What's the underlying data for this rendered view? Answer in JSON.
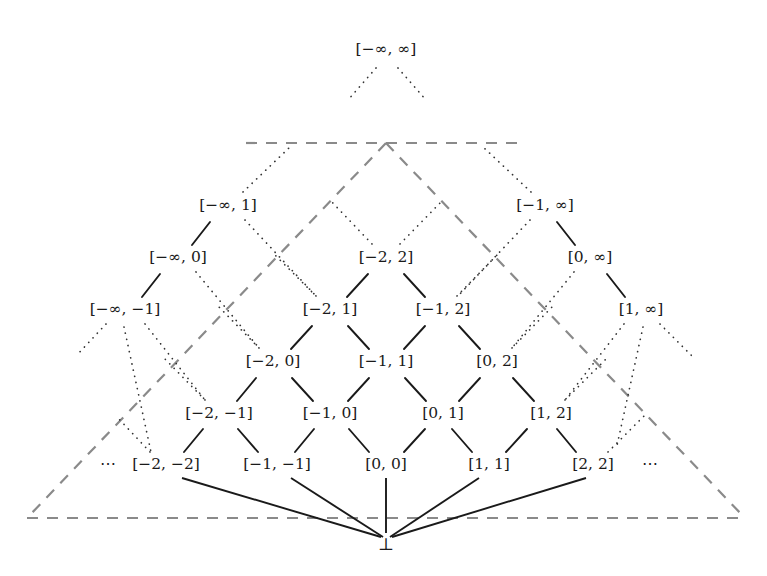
{
  "figure": {
    "kind": "lattice-hasse-diagram",
    "background_color": "#ffffff",
    "ink_color": "#1a1a1a",
    "boundary_color": "#8a8a8a"
  },
  "nodes": {
    "top": {
      "id": "top",
      "label": "[−∞, ∞]",
      "x": 386,
      "y": 50
    },
    "left_chain": [
      {
        "id": "ninf_1",
        "label": "[−∞, 1]",
        "x": 228,
        "y": 206
      },
      {
        "id": "ninf_0",
        "label": "[−∞, 0]",
        "x": 178,
        "y": 258
      },
      {
        "id": "ninf_m1",
        "label": "[−∞, −1]",
        "x": 125,
        "y": 310
      }
    ],
    "right_chain": [
      {
        "id": "m1_inf",
        "label": "[−1, ∞]",
        "x": 545,
        "y": 206
      },
      {
        "id": "p0_inf",
        "label": "[0, ∞]",
        "x": 590,
        "y": 258
      },
      {
        "id": "p1_inf",
        "label": "[1, ∞]",
        "x": 641,
        "y": 310
      }
    ],
    "core_rows": [
      {
        "row": 0,
        "y": 258,
        "items": [
          {
            "id": "m2_2",
            "label": "[−2, 2]",
            "x": 386
          }
        ]
      },
      {
        "row": 1,
        "y": 310,
        "items": [
          {
            "id": "m2_1",
            "label": "[−2, 1]",
            "x": 330
          },
          {
            "id": "m1_2",
            "label": "[−1, 2]",
            "x": 443
          }
        ]
      },
      {
        "row": 2,
        "y": 362,
        "items": [
          {
            "id": "m2_0",
            "label": "[−2, 0]",
            "x": 273
          },
          {
            "id": "m1_1",
            "label": "[−1, 1]",
            "x": 386
          },
          {
            "id": "p0_2",
            "label": "[0, 2]",
            "x": 497
          }
        ]
      },
      {
        "row": 3,
        "y": 414,
        "items": [
          {
            "id": "m2_m1",
            "label": "[−2, −1]",
            "x": 219
          },
          {
            "id": "m1_0",
            "label": "[−1, 0]",
            "x": 330
          },
          {
            "id": "p0_1",
            "label": "[0, 1]",
            "x": 443
          },
          {
            "id": "p1_2",
            "label": "[1, 2]",
            "x": 551
          }
        ]
      },
      {
        "row": 4,
        "y": 465,
        "items": [
          {
            "id": "m2_m2",
            "label": "[−2, −2]",
            "x": 166
          },
          {
            "id": "m1_m1",
            "label": "[−1, −1]",
            "x": 277
          },
          {
            "id": "p0_0",
            "label": "[0, 0]",
            "x": 386
          },
          {
            "id": "p1_1",
            "label": "[1, 1]",
            "x": 489
          },
          {
            "id": "p2_2",
            "label": "[2, 2]",
            "x": 593
          }
        ]
      }
    ],
    "bottom": {
      "id": "bottom",
      "label": "⊥",
      "x": 386,
      "y": 545
    },
    "ellipses": [
      {
        "id": "ellipsis-left",
        "label": "⋯",
        "x": 108,
        "y": 465
      },
      {
        "id": "ellipsis-right",
        "label": "⋯",
        "x": 650,
        "y": 465
      }
    ]
  },
  "boundary": {
    "name": "dashed-triangle",
    "apex": {
      "x": 386,
      "y": 143
    },
    "top_edge": {
      "x1": 246,
      "y1": 143,
      "x2": 526,
      "y2": 143
    },
    "bottom_edge": {
      "x1": 27,
      "y1": 518,
      "x2": 745,
      "y2": 518
    },
    "left_edge": {
      "x1": 386,
      "y1": 143,
      "x2": 27,
      "y2": 518
    },
    "right_edge": {
      "x1": 386,
      "y1": 143,
      "x2": 745,
      "y2": 518
    }
  },
  "edges": {
    "solid_short": [
      {
        "from": "ninf_0",
        "to": "ninf_1"
      },
      {
        "from": "ninf_m1",
        "to": "ninf_0"
      },
      {
        "from": "m1_inf",
        "to": "p0_inf"
      },
      {
        "from": "p0_inf",
        "to": "p1_inf"
      },
      {
        "from": "m2_1",
        "to": "m2_2"
      },
      {
        "from": "m1_2",
        "to": "m2_2"
      },
      {
        "from": "m2_0",
        "to": "m2_1"
      },
      {
        "from": "m1_1",
        "to": "m2_1"
      },
      {
        "from": "m1_1",
        "to": "m1_2"
      },
      {
        "from": "p0_2",
        "to": "m1_2"
      },
      {
        "from": "m2_m1",
        "to": "m2_0"
      },
      {
        "from": "m1_0",
        "to": "m2_0"
      },
      {
        "from": "m1_0",
        "to": "m1_1"
      },
      {
        "from": "p0_1",
        "to": "m1_1"
      },
      {
        "from": "p0_1",
        "to": "p0_2"
      },
      {
        "from": "p1_2",
        "to": "p0_2"
      },
      {
        "from": "m2_m2",
        "to": "m2_m1"
      },
      {
        "from": "m1_m1",
        "to": "m2_m1"
      },
      {
        "from": "m1_m1",
        "to": "m1_0"
      },
      {
        "from": "p0_0",
        "to": "m1_0"
      },
      {
        "from": "p0_0",
        "to": "p0_1"
      },
      {
        "from": "p1_1",
        "to": "p0_1"
      },
      {
        "from": "p1_1",
        "to": "p1_2"
      },
      {
        "from": "p2_2",
        "to": "p1_2"
      }
    ],
    "bottom_fan": [
      {
        "from": "bottom",
        "to": "m2_m2"
      },
      {
        "from": "bottom",
        "to": "m1_m1"
      },
      {
        "from": "bottom",
        "to": "p0_0"
      },
      {
        "from": "bottom",
        "to": "p1_1"
      },
      {
        "from": "bottom",
        "to": "p2_2"
      }
    ],
    "dotted_count": 22
  }
}
